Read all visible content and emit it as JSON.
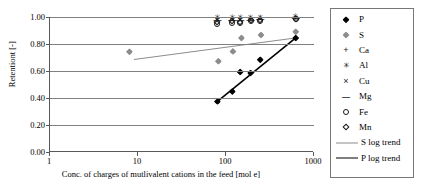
{
  "chart_data": {
    "type": "scatter",
    "title": "",
    "xlabel": "Conc. of charges of mutlivalent cations in the feed [mol e]",
    "ylabel": "Retentiont [-]",
    "xscale": "log",
    "xlim": [
      1,
      1000
    ],
    "ylim": [
      0.0,
      1.0
    ],
    "xticks": [
      "1",
      "10",
      "100",
      "1000"
    ],
    "xtick_values": [
      1,
      10,
      100,
      1000
    ],
    "yticks": [
      "0.00",
      "0.20",
      "0.40",
      "0.60",
      "0.80",
      "1.00"
    ],
    "ytick_values": [
      0.0,
      0.2,
      0.4,
      0.6,
      0.8,
      1.0
    ],
    "grid": "horizontal",
    "legend_position": "right-outside",
    "series": [
      {
        "name": "P",
        "marker": "filled-diamond",
        "color": "#000000",
        "points": [
          {
            "x": 80,
            "y": 0.375
          },
          {
            "x": 118,
            "y": 0.448
          },
          {
            "x": 145,
            "y": 0.593
          },
          {
            "x": 190,
            "y": 0.585
          },
          {
            "x": 245,
            "y": 0.683
          },
          {
            "x": 620,
            "y": 0.845
          }
        ]
      },
      {
        "name": "S",
        "marker": "filled-diamond",
        "color": "#8c8c8c",
        "points": [
          {
            "x": 8,
            "y": 0.742
          },
          {
            "x": 82,
            "y": 0.672
          },
          {
            "x": 120,
            "y": 0.745
          },
          {
            "x": 150,
            "y": 0.845
          },
          {
            "x": 250,
            "y": 0.867
          },
          {
            "x": 620,
            "y": 0.89
          }
        ]
      },
      {
        "name": "Ca",
        "marker": "plus",
        "color": "#1a1a1a",
        "points": [
          {
            "x": 80,
            "y": 0.985
          },
          {
            "x": 118,
            "y": 0.988
          },
          {
            "x": 145,
            "y": 0.985
          },
          {
            "x": 190,
            "y": 0.985
          },
          {
            "x": 245,
            "y": 0.99
          },
          {
            "x": 620,
            "y": 0.995
          }
        ]
      },
      {
        "name": "Al",
        "marker": "asterisk",
        "color": "#1a1a1a",
        "points": [
          {
            "x": 80,
            "y": 0.99
          },
          {
            "x": 118,
            "y": 0.992
          },
          {
            "x": 145,
            "y": 0.99
          },
          {
            "x": 190,
            "y": 0.99
          },
          {
            "x": 245,
            "y": 0.993
          },
          {
            "x": 620,
            "y": 0.997
          }
        ]
      },
      {
        "name": "Cu",
        "marker": "cross",
        "color": "#1a1a1a",
        "points": [
          {
            "x": 80,
            "y": 0.98
          },
          {
            "x": 118,
            "y": 0.983
          },
          {
            "x": 145,
            "y": 0.98
          },
          {
            "x": 190,
            "y": 0.982
          },
          {
            "x": 245,
            "y": 0.988
          },
          {
            "x": 620,
            "y": 0.992
          }
        ]
      },
      {
        "name": "Mg",
        "marker": "dash",
        "color": "#1a1a1a",
        "points": [
          {
            "x": 80,
            "y": 0.975
          },
          {
            "x": 118,
            "y": 0.978
          },
          {
            "x": 145,
            "y": 0.975
          },
          {
            "x": 190,
            "y": 0.977
          },
          {
            "x": 245,
            "y": 0.982
          },
          {
            "x": 620,
            "y": 0.99
          }
        ]
      },
      {
        "name": "Fe",
        "marker": "open-circle",
        "color": "#1a1a1a",
        "points": [
          {
            "x": 80,
            "y": 0.945
          },
          {
            "x": 118,
            "y": 0.955
          },
          {
            "x": 145,
            "y": 0.952
          },
          {
            "x": 190,
            "y": 0.968
          },
          {
            "x": 245,
            "y": 0.97
          },
          {
            "x": 620,
            "y": 0.985
          }
        ]
      },
      {
        "name": "Mn",
        "marker": "open-diamond",
        "color": "#1a1a1a",
        "points": [
          {
            "x": 80,
            "y": 0.96
          },
          {
            "x": 118,
            "y": 0.968
          },
          {
            "x": 145,
            "y": 0.962
          },
          {
            "x": 190,
            "y": 0.975
          },
          {
            "x": 245,
            "y": 0.978
          },
          {
            "x": 620,
            "y": 0.988
          }
        ]
      }
    ],
    "trendlines": [
      {
        "name": "S log trend",
        "color": "#8c8c8c",
        "width": 1,
        "from": {
          "x": 9,
          "y": 0.685
        },
        "to": {
          "x": 620,
          "y": 0.845
        }
      },
      {
        "name": "P log trend",
        "color": "#000000",
        "width": 1.6,
        "from": {
          "x": 80,
          "y": 0.375
        },
        "to": {
          "x": 620,
          "y": 0.845
        }
      }
    ]
  },
  "legend": {
    "items": [
      {
        "label": "P",
        "marker": "filled-diamond"
      },
      {
        "label": "S",
        "marker": "filled-diamond-gray"
      },
      {
        "label": "Ca",
        "marker": "plus"
      },
      {
        "label": "Al",
        "marker": "asterisk"
      },
      {
        "label": "Cu",
        "marker": "cross"
      },
      {
        "label": "Mg",
        "marker": "dash"
      },
      {
        "label": "Fe",
        "marker": "open-circle"
      },
      {
        "label": "Mn",
        "marker": "open-diamond"
      },
      {
        "label": "S log trend",
        "marker": "line-gray"
      },
      {
        "label": "P log trend",
        "marker": "line-black"
      }
    ]
  }
}
